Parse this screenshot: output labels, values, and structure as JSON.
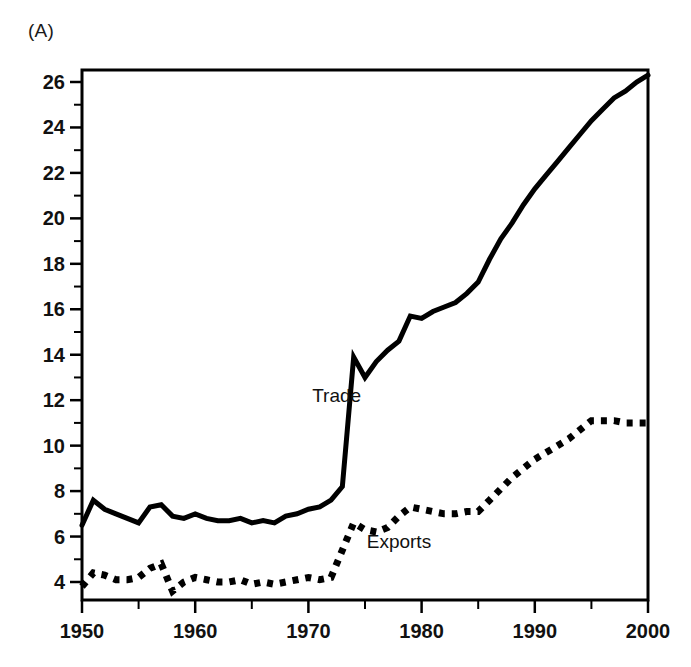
{
  "figure": {
    "panel_label": "(A)",
    "background_color": "#ffffff",
    "line_color": "#000000"
  },
  "chart_data": {
    "type": "line",
    "title": "",
    "subtitle": "",
    "xlabel": "",
    "ylabel": "",
    "xlim": [
      1950,
      2000
    ],
    "ylim": [
      3,
      27
    ],
    "grid": false,
    "legend_position": "inline-annotation",
    "x_ticks_major": [
      1950,
      1960,
      1970,
      1980,
      1990,
      2000
    ],
    "x_tick_labels": [
      "1950",
      "1960",
      "1970",
      "1980",
      "1990",
      "2000"
    ],
    "x_ticks_minor": [
      1955,
      1965,
      1975,
      1985,
      1995
    ],
    "y_ticks_major": [
      4,
      6,
      8,
      10,
      12,
      14,
      16,
      18,
      20,
      22,
      24,
      26
    ],
    "y_tick_labels": [
      "4",
      "6",
      "8",
      "10",
      "12",
      "14",
      "16",
      "18",
      "20",
      "22",
      "24",
      "26"
    ],
    "y_ticks_minor": [
      5,
      7,
      9,
      11,
      13,
      15,
      17,
      19,
      21,
      23,
      25
    ],
    "x": [
      1950,
      1951,
      1952,
      1953,
      1954,
      1955,
      1956,
      1957,
      1958,
      1959,
      1960,
      1961,
      1962,
      1963,
      1964,
      1965,
      1966,
      1967,
      1968,
      1969,
      1970,
      1971,
      1972,
      1973,
      1974,
      1975,
      1976,
      1977,
      1978,
      1979,
      1980,
      1981,
      1982,
      1983,
      1984,
      1985,
      1986,
      1987,
      1988,
      1989,
      1990,
      1991,
      1992,
      1993,
      1994,
      1995,
      1996,
      1997,
      1998,
      1999,
      2000
    ],
    "series": [
      {
        "name": "Trade",
        "style": "solid",
        "label_text": "Trade",
        "values": [
          6.5,
          7.6,
          7.2,
          7.0,
          6.8,
          6.6,
          7.3,
          7.4,
          6.9,
          6.8,
          7.0,
          6.8,
          6.7,
          6.7,
          6.8,
          6.6,
          6.7,
          6.6,
          6.9,
          7.0,
          7.2,
          7.3,
          7.6,
          8.2,
          13.9,
          13.0,
          13.7,
          14.2,
          14.6,
          15.7,
          15.6,
          15.9,
          16.1,
          16.3,
          16.7,
          17.2,
          18.2,
          19.1,
          19.8,
          20.6,
          21.3,
          21.9,
          22.5,
          23.1,
          23.7,
          24.3,
          24.8,
          25.3,
          25.6,
          26.0,
          26.3
        ]
      },
      {
        "name": "Exports",
        "style": "dotted",
        "label_text": "Exports",
        "values": [
          3.8,
          4.4,
          4.3,
          4.1,
          4.1,
          4.2,
          4.6,
          4.8,
          3.6,
          4.0,
          4.2,
          4.1,
          4.0,
          4.0,
          4.1,
          3.9,
          4.0,
          3.9,
          4.0,
          4.1,
          4.2,
          4.1,
          4.2,
          5.4,
          6.6,
          6.3,
          6.2,
          6.4,
          6.9,
          7.3,
          7.2,
          7.1,
          7.0,
          7.0,
          7.1,
          7.1,
          7.6,
          8.1,
          8.6,
          9.0,
          9.4,
          9.7,
          10.0,
          10.3,
          10.7,
          11.1,
          11.1,
          11.1,
          11.0,
          11.0,
          11.0
        ]
      }
    ],
    "annotations": [
      {
        "text": "Trade",
        "x": 1972.5,
        "y": 11.9
      },
      {
        "text": "Exports",
        "x": 1978.0,
        "y": 5.5
      }
    ]
  }
}
